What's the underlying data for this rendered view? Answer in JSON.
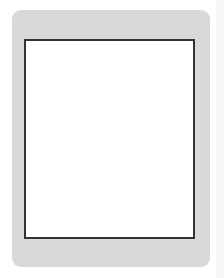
{
  "board": {
    "top_numbers": [
      "1",
      "2",
      "3",
      "4",
      "5",
      "6",
      "7",
      "8",
      "9"
    ],
    "bottom_numbers": [
      "九",
      "八",
      "七",
      "六",
      "五",
      "四",
      "三",
      "二",
      "一"
    ],
    "caption": "第 图",
    "colors": {
      "panel": "#d9d9d9",
      "black_piece": "#111111",
      "red_piece": "#5f5f5f",
      "grid": "#333333"
    }
  },
  "pieces": [
    {
      "side": "black",
      "label": "炮",
      "col": 1,
      "row": 0
    },
    {
      "side": "black",
      "label": "将",
      "col": 5,
      "row": 0
    },
    {
      "side": "black",
      "label": "士",
      "col": 6,
      "row": 0
    },
    {
      "side": "black",
      "label": "车",
      "col": 3,
      "row": 1
    },
    {
      "side": "black",
      "label": "马",
      "col": 1,
      "row": 2
    },
    {
      "side": "black",
      "label": "士",
      "col": 4,
      "row": 2
    },
    {
      "side": "black",
      "label": "象",
      "col": 5,
      "row": 2
    },
    {
      "side": "black",
      "label": "马",
      "col": 7,
      "row": 2
    },
    {
      "side": "black",
      "label": "炮",
      "col": 9,
      "row": 2
    },
    {
      "side": "black",
      "label": "卒",
      "col": 1,
      "row": 3
    },
    {
      "side": "black",
      "label": "卒",
      "col": 7,
      "row": 3
    },
    {
      "side": "black",
      "label": "卒",
      "col": 9,
      "row": 3
    },
    {
      "side": "black",
      "label": "卒",
      "col": 5,
      "row": 4
    },
    {
      "side": "red",
      "label": "车",
      "col": 2,
      "row": 5
    },
    {
      "side": "red",
      "label": "兵",
      "col": 1,
      "row": 6
    },
    {
      "side": "red",
      "label": "兵",
      "col": 7,
      "row": 6
    },
    {
      "side": "red",
      "label": "兵",
      "col": 9,
      "row": 6
    },
    {
      "side": "red",
      "label": "马",
      "col": 1,
      "row": 7
    },
    {
      "side": "black",
      "label": "炮",
      "col": 3,
      "row": 7
    },
    {
      "side": "red",
      "label": "炮",
      "col": 5,
      "row": 7
    },
    {
      "side": "red",
      "label": "仕",
      "col": 5,
      "row": 8
    },
    {
      "side": "red",
      "label": "马",
      "col": 9,
      "row": 8
    },
    {
      "side": "red",
      "label": "帅",
      "col": 5,
      "row": 9
    },
    {
      "side": "red",
      "label": "仕",
      "col": 6,
      "row": 9
    },
    {
      "side": "red",
      "label": "相",
      "col": 7,
      "row": 9
    }
  ]
}
